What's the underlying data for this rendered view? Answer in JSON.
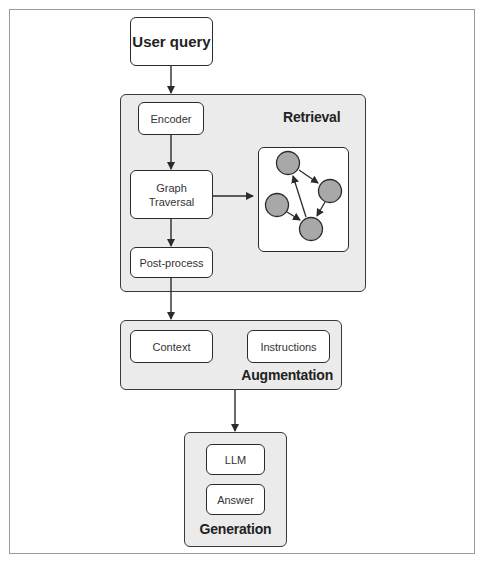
{
  "diagram": {
    "nodes": {
      "user_query": "User query",
      "encoder": "Encoder",
      "graph_traversal_line1": "Graph",
      "graph_traversal_line2": "Traversal",
      "post_process": "Post-process",
      "context": "Context",
      "instructions": "Instructions",
      "llm": "LLM",
      "answer": "Answer"
    },
    "groups": {
      "retrieval": "Retrieval",
      "augmentation": "Augmentation",
      "generation": "Generation"
    },
    "graph_icon": {
      "nodes": [
        "top",
        "right",
        "left",
        "bottom"
      ],
      "edges": [
        [
          "top",
          "right"
        ],
        [
          "right",
          "bottom"
        ],
        [
          "left",
          "bottom"
        ],
        [
          "bottom",
          "top"
        ]
      ]
    },
    "flow": [
      [
        "User query",
        "Encoder"
      ],
      [
        "Encoder",
        "Graph Traversal"
      ],
      [
        "Graph Traversal",
        "Graph"
      ],
      [
        "Graph Traversal",
        "Post-process"
      ],
      [
        "Post-process",
        "Augmentation"
      ],
      [
        "Augmentation",
        "Generation"
      ]
    ],
    "colors": {
      "group_fill": "#ebebeb",
      "box_fill": "#ffffff",
      "stroke": "#2b2b2b",
      "graph_node_fill": "#a8a8a8"
    }
  }
}
